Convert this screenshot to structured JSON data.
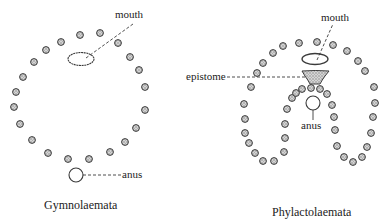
{
  "colors": {
    "ink": "#3a3a3a",
    "tentacle_fill": "#b9b9b9",
    "stipple": "#8a8a8a",
    "background": "#ffffff"
  },
  "diagrams": [
    {
      "name": "Gymnolaemata",
      "caption": "Gymnolaemata",
      "labels": {
        "mouth": "mouth",
        "anus": "anus"
      },
      "tentacles": [
        [
          80,
          35
        ],
        [
          61,
          42
        ],
        [
          46,
          50
        ],
        [
          34,
          62
        ],
        [
          23,
          77
        ],
        [
          16,
          92
        ],
        [
          14,
          107
        ],
        [
          20,
          124
        ],
        [
          32,
          140
        ],
        [
          48,
          153
        ],
        [
          68,
          159
        ],
        [
          89,
          159
        ],
        [
          110,
          152
        ],
        [
          125,
          142
        ],
        [
          136,
          128
        ],
        [
          145,
          110
        ],
        [
          145,
          87
        ],
        [
          139,
          70
        ],
        [
          130,
          57
        ],
        [
          118,
          43
        ],
        [
          100,
          33
        ]
      ],
      "mouth": {
        "cx": 81,
        "cy": 59,
        "rx": 13,
        "ry": 6.5
      },
      "anus": {
        "cx": 76,
        "cy": 175,
        "r": 7
      }
    },
    {
      "name": "Phylactolaemata",
      "caption": "Phylactolaemata",
      "labels": {
        "mouth": "mouth",
        "anus": "anus",
        "epistome": "epistome"
      },
      "tentacles": [
        [
          299,
          43
        ],
        [
          283,
          46
        ],
        [
          273,
          53
        ],
        [
          263,
          63
        ],
        [
          257,
          73
        ],
        [
          251,
          87
        ],
        [
          244,
          104
        ],
        [
          245,
          119
        ],
        [
          245,
          133
        ],
        [
          249,
          143
        ],
        [
          255,
          153
        ],
        [
          263,
          161
        ],
        [
          274,
          161
        ],
        [
          284,
          152
        ],
        [
          285,
          138
        ],
        [
          285,
          124
        ],
        [
          287,
          109
        ],
        [
          292,
          98
        ],
        [
          296,
          93
        ],
        [
          302,
          89
        ],
        [
          311,
          88
        ],
        [
          320,
          89
        ],
        [
          327,
          94
        ],
        [
          332,
          105
        ],
        [
          334,
          117
        ],
        [
          335,
          130
        ],
        [
          337,
          146
        ],
        [
          344,
          157
        ],
        [
          353,
          162
        ],
        [
          362,
          157
        ],
        [
          367,
          147
        ],
        [
          371,
          133
        ],
        [
          373,
          117
        ],
        [
          375,
          103
        ],
        [
          374,
          87
        ],
        [
          365,
          71
        ],
        [
          358,
          61
        ],
        [
          347,
          51
        ],
        [
          333,
          45
        ],
        [
          317,
          42
        ]
      ],
      "mouth": {
        "cx": 315,
        "cy": 59,
        "rx": 13,
        "ry": 5.5
      },
      "anus": {
        "cx": 313,
        "cy": 103,
        "r": 7
      }
    }
  ]
}
